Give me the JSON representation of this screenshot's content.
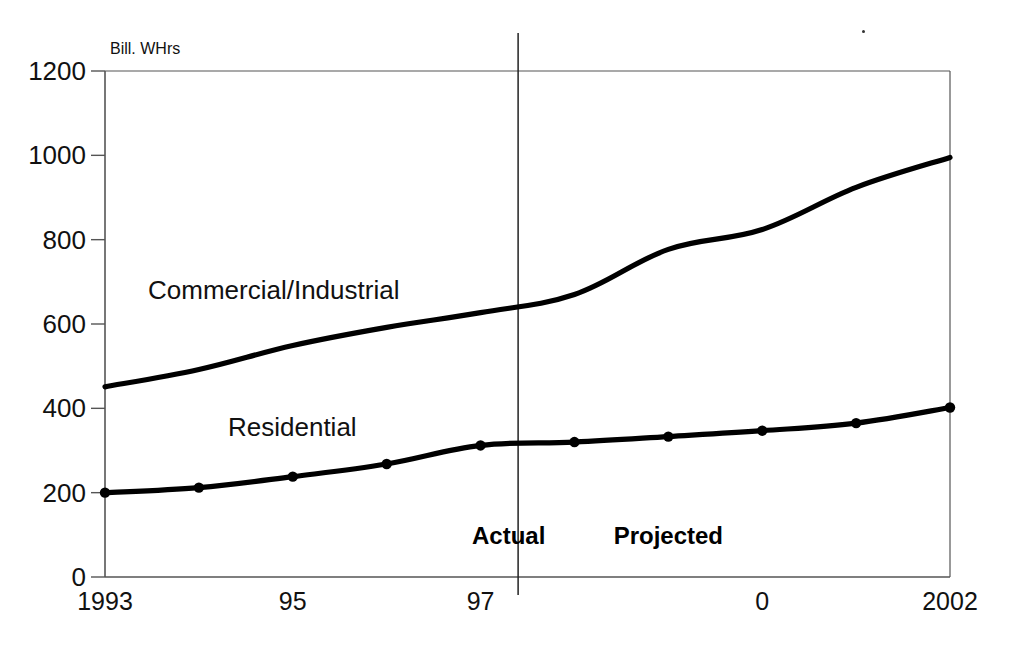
{
  "chart_data": {
    "type": "line",
    "title": "",
    "subtitle": "",
    "xlabel": "",
    "ylabel": "Bill. WHrs",
    "unit_label": "Bill. WHrs",
    "grid": false,
    "legend_position": "inline-annotations",
    "x": [
      1993,
      1994,
      1995,
      1996,
      1997,
      1998,
      1999,
      2000,
      2001,
      2002
    ],
    "xtick_labels": [
      "1993",
      "95",
      "97",
      "0",
      "2002"
    ],
    "xtick_values": [
      1993,
      1995,
      1997,
      2000,
      2002
    ],
    "ytick_labels": [
      "0",
      "200",
      "400",
      "600",
      "800",
      "1000",
      "1200"
    ],
    "ytick_values": [
      0,
      200,
      400,
      600,
      800,
      1000,
      1200
    ],
    "ylim": [
      0,
      1200
    ],
    "xlim": [
      1993,
      2002
    ],
    "series": [
      {
        "name": "Commercial/Industrial",
        "label_text": "Commercial/Industrial",
        "markers": false,
        "color": "#000000",
        "values": [
          451,
          492,
          549,
          592,
          627,
          670,
          777,
          824,
          924,
          995
        ]
      },
      {
        "name": "Residential",
        "label_text": "Residential",
        "markers": true,
        "color": "#000000",
        "values": [
          200,
          212,
          238,
          268,
          312,
          320,
          333,
          347,
          365,
          402
        ]
      }
    ],
    "annotations": [
      {
        "text": "Actual",
        "x": 1997.3,
        "y": 130,
        "bold": true
      },
      {
        "text": "Projected",
        "x": 1999.0,
        "y": 130,
        "bold": true
      }
    ],
    "divider": {
      "x": 1997.4,
      "label_left": "Actual",
      "label_right": "Projected"
    },
    "colors": {
      "line": "#000000",
      "axis": "#555555",
      "text": "#111111"
    }
  }
}
